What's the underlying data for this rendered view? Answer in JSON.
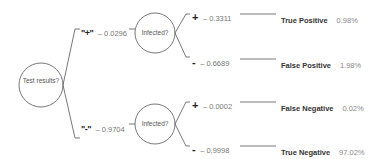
{
  "diagram": {
    "type": "probability-tree",
    "root": {
      "label": "Test results?"
    },
    "branches": [
      {
        "sign": "\"+\"",
        "probability": "– 0.0296",
        "node_label": "Infected?",
        "leaves": [
          {
            "sign": "+",
            "probability": "– 0.3311",
            "outcome": "True Positive",
            "percent": "0.98%"
          },
          {
            "sign": "-",
            "probability": "– 0.6689",
            "outcome": "False Positive",
            "percent": "1.98%"
          }
        ]
      },
      {
        "sign": "\"-\"",
        "probability": "– 0.9704",
        "node_label": "Infected?",
        "leaves": [
          {
            "sign": "+",
            "probability": "– 0.0002",
            "outcome": "False Negative",
            "percent": "0.02%"
          },
          {
            "sign": "-",
            "probability": "– 0.9998",
            "outcome": "True Negative",
            "percent": "97.02%"
          }
        ]
      }
    ],
    "colors": {
      "line": "#555555",
      "text": "#555555",
      "bold_text": "#222222"
    }
  }
}
